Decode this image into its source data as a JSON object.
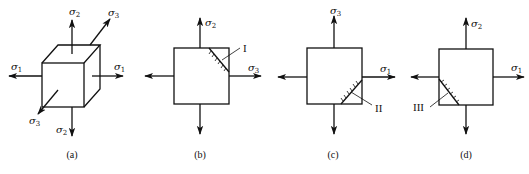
{
  "figure": {
    "panels": [
      {
        "id": "a",
        "caption": "(a)",
        "shape": "cube",
        "labels": {
          "top": {
            "sym": "σ",
            "sub": "2"
          },
          "bottom": {
            "sym": "σ",
            "sub": "2"
          },
          "left": {
            "sym": "σ",
            "sub": "1"
          },
          "right": {
            "sym": "σ",
            "sub": "1"
          },
          "back": {
            "sym": "σ",
            "sub": "3"
          },
          "front": {
            "sym": "σ",
            "sub": "3"
          }
        }
      },
      {
        "id": "b",
        "caption": "(b)",
        "shape": "square",
        "plane_label": "I",
        "labels": {
          "top": {
            "sym": "σ",
            "sub": "2"
          },
          "right": {
            "sym": "σ",
            "sub": "3"
          }
        }
      },
      {
        "id": "c",
        "caption": "(c)",
        "shape": "square",
        "plane_label": "II",
        "labels": {
          "top": {
            "sym": "σ",
            "sub": "3"
          },
          "right": {
            "sym": "σ",
            "sub": "1"
          }
        }
      },
      {
        "id": "d",
        "caption": "(d)",
        "shape": "square",
        "plane_label": "III",
        "labels": {
          "top": {
            "sym": "σ",
            "sub": "2"
          },
          "right": {
            "sym": "σ",
            "sub": "1"
          }
        }
      }
    ]
  }
}
